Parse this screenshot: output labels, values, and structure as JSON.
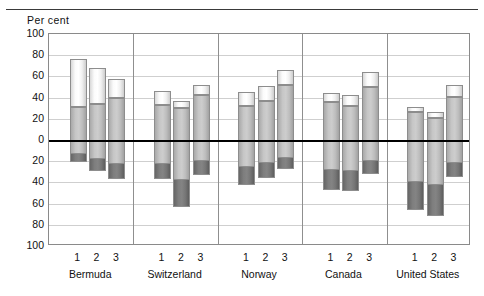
{
  "axis_title": "Per cent",
  "chart_data": {
    "type": "bar",
    "title": "",
    "subtitle": "",
    "xlabel": "",
    "ylabel": "Per cent",
    "ylim": [
      -100,
      100
    ],
    "yticks": [
      100,
      80,
      60,
      40,
      20,
      0,
      20,
      40,
      60,
      80,
      100
    ],
    "ytick_values": [
      100,
      80,
      60,
      40,
      20,
      0,
      -20,
      -40,
      -60,
      -80,
      -100
    ],
    "grid": true,
    "legend": "none",
    "stacked": true,
    "group_labels": [
      "Bermuda",
      "Switzerland",
      "Norway",
      "Canada",
      "United States"
    ],
    "bar_labels": [
      "1",
      "2",
      "3"
    ],
    "series": [
      {
        "name": "lower-dark",
        "color": "#7a7a7a",
        "values": [
          -21,
          -29,
          -37,
          -37,
          -63,
          -33,
          -42,
          -36,
          -27,
          -47,
          -48,
          -32,
          -66,
          -72,
          -35
        ]
      },
      {
        "name": "middle-grey",
        "color": "#c4c4c4",
        "values": [
          31,
          34,
          40,
          33,
          30,
          42,
          32,
          37,
          52,
          36,
          32,
          50,
          26,
          21,
          41
        ]
      },
      {
        "name": "upper-white",
        "color": "#fdfdfd",
        "values": [
          76,
          68,
          58,
          46,
          37,
          52,
          45,
          51,
          66,
          44,
          42,
          64,
          31,
          26,
          52
        ]
      }
    ],
    "bars": [
      {
        "group": "Bermuda",
        "label": "1",
        "top": 76,
        "mid": 31,
        "bottom": -21
      },
      {
        "group": "Bermuda",
        "label": "2",
        "top": 68,
        "mid": 34,
        "bottom": -29
      },
      {
        "group": "Bermuda",
        "label": "3",
        "top": 58,
        "mid": 40,
        "bottom": -37
      },
      {
        "group": "Switzerland",
        "label": "1",
        "top": 46,
        "mid": 33,
        "bottom": -37
      },
      {
        "group": "Switzerland",
        "label": "2",
        "top": 37,
        "mid": 30,
        "bottom": -63
      },
      {
        "group": "Switzerland",
        "label": "3",
        "top": 52,
        "mid": 42,
        "bottom": -33
      },
      {
        "group": "Norway",
        "label": "1",
        "top": 45,
        "mid": 32,
        "bottom": -42
      },
      {
        "group": "Norway",
        "label": "2",
        "top": 51,
        "mid": 37,
        "bottom": -36
      },
      {
        "group": "Norway",
        "label": "3",
        "top": 66,
        "mid": 52,
        "bottom": -27
      },
      {
        "group": "Canada",
        "label": "1",
        "top": 44,
        "mid": 36,
        "bottom": -47
      },
      {
        "group": "Canada",
        "label": "2",
        "top": 42,
        "mid": 32,
        "bottom": -48
      },
      {
        "group": "Canada",
        "label": "3",
        "top": 64,
        "mid": 50,
        "bottom": -32
      },
      {
        "group": "United States",
        "label": "1",
        "top": 31,
        "mid": 26,
        "bottom": -66
      },
      {
        "group": "United States",
        "label": "2",
        "top": 26,
        "mid": 21,
        "bottom": -72
      },
      {
        "group": "United States",
        "label": "3",
        "top": 52,
        "mid": 41,
        "bottom": -35
      }
    ]
  },
  "colors": {
    "segment_top": "#fdfdfd",
    "segment_mid": "#c4c4c4",
    "segment_bottom": "#7a7a7a",
    "gridline": "#cfcfcf",
    "zeroline": "#000000",
    "frame": "#8a8a8a"
  }
}
